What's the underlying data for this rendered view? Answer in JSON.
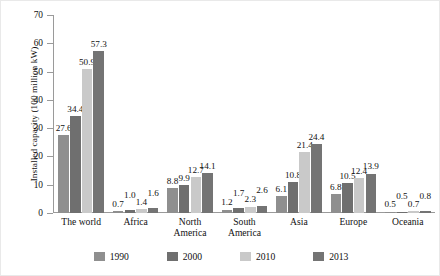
{
  "chart_data": {
    "type": "bar",
    "title": "",
    "xlabel": "",
    "ylabel": "Installed capacity (100 million kW)",
    "ylim": [
      0,
      70
    ],
    "yticks": [
      "0",
      "10",
      "20",
      "30",
      "40",
      "50",
      "60",
      "70"
    ],
    "grid": false,
    "legend_position": "bottom",
    "categories": [
      "The world",
      "Africa",
      "North\nAmerica",
      "South\nAmerica",
      "Asia",
      "Europe",
      "Oceania"
    ],
    "series": [
      {
        "name": "1990",
        "color": "#8f8f8f",
        "values": [
          27.6,
          0.7,
          8.8,
          1.2,
          6.1,
          6.8,
          0.5
        ]
      },
      {
        "name": "2000",
        "color": "#6f6f6f",
        "values": [
          34.4,
          1.0,
          9.9,
          1.7,
          10.8,
          10.5,
          0.5
        ]
      },
      {
        "name": "2010",
        "color": "#c9c9c9",
        "values": [
          50.9,
          1.4,
          12.7,
          2.3,
          21.4,
          12.4,
          0.7
        ]
      },
      {
        "name": "2013",
        "color": "#747474",
        "values": [
          57.3,
          1.6,
          14.1,
          2.6,
          24.4,
          13.9,
          0.8
        ]
      }
    ],
    "value_labels": [
      [
        "27.6",
        "34.4",
        "50.9",
        "57.3"
      ],
      [
        "0.7",
        "1.0",
        "1.4",
        "1.6"
      ],
      [
        "8.8",
        "9.9",
        "12.7",
        "14.1"
      ],
      [
        "1.2",
        "1.7",
        "2.3",
        "2.6"
      ],
      [
        "6.1",
        "10.8",
        "21.4",
        "24.4"
      ],
      [
        "6.8",
        "10.5",
        "12.4",
        "13.9"
      ],
      [
        "0.5",
        "0.5",
        "0.7",
        "0.8"
      ]
    ]
  },
  "legend": {
    "items": [
      {
        "label": "1990",
        "color": "#8f8f8f"
      },
      {
        "label": "2000",
        "color": "#6f6f6f"
      },
      {
        "label": "2010",
        "color": "#c9c9c9"
      },
      {
        "label": "2013",
        "color": "#747474"
      }
    ]
  },
  "axis": {
    "y_title": "Installed capacity (100 million kW)"
  }
}
